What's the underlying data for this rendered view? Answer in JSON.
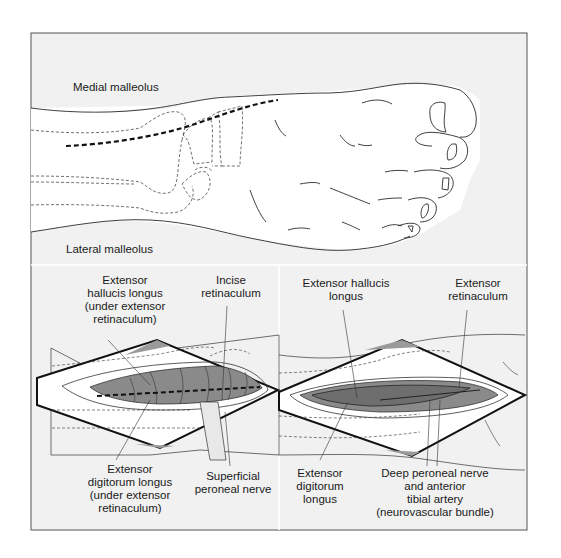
{
  "figure": {
    "top_panel": {
      "labels": {
        "medial_malleolus": "Medial malleolus",
        "lateral_malleolus": "Lateral malleolus"
      }
    },
    "bottom_left_panel": {
      "labels": {
        "ehl": "Extensor\nhallucis longus\n(under extensor\nretinaculum)",
        "incise": "Incise\nretinaculum",
        "edl": "Extensor\ndigitorum longus\n(under extensor\nretinaculum)",
        "spn": "Superficial\nperoneal nerve"
      }
    },
    "bottom_right_panel": {
      "labels": {
        "ehl": "Extensor hallucis\nlongus",
        "retinaculum": "Extensor\nretinaculum",
        "edl": "Extensor\ndigitorum\nlongus",
        "dpn": "Deep peroneal nerve\nand anterior\ntibial artery\n(neurovascular bundle)"
      }
    },
    "colors": {
      "panel_bg": "#f1f1f1",
      "skin": "#ffffff",
      "line": "#2a2a2a",
      "muscle": "#8a8a8a",
      "muscle_dark": "#6e6e6e",
      "flap_gray": "#9a9a9a"
    }
  }
}
